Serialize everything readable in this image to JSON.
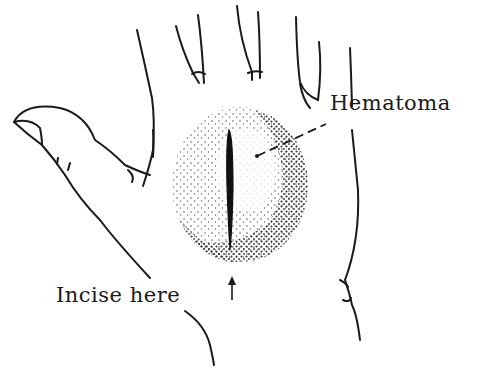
{
  "figure": {
    "labels": {
      "hematoma": "Hematoma",
      "incise": "Incise here"
    },
    "colors": {
      "ink": "#1a1a1a",
      "background": "#ffffff",
      "stipple": "#2a2a2a"
    }
  }
}
